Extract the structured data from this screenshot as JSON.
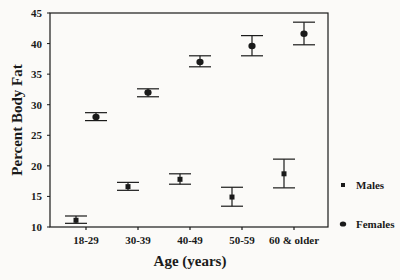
{
  "chart_data": {
    "type": "scatter",
    "subtype": "error-bar",
    "title": "",
    "xlabel": "Age (years)",
    "ylabel": "Percent Body Fat",
    "categories": [
      "18-29",
      "30-39",
      "40-49",
      "50-59",
      "60 & older"
    ],
    "ylim": [
      10,
      45
    ],
    "yticks": [
      10,
      15,
      20,
      25,
      30,
      35,
      40,
      45
    ],
    "grid": false,
    "legend_position": "right",
    "series": [
      {
        "name": "Males",
        "marker": "square",
        "values": [
          11.1,
          16.6,
          17.8,
          14.9,
          18.7
        ],
        "upper": [
          11.8,
          17.3,
          18.7,
          16.5,
          21.1
        ],
        "lower": [
          10.6,
          16.0,
          17.0,
          13.4,
          16.4
        ]
      },
      {
        "name": "Females",
        "marker": "circle",
        "values": [
          28.0,
          32.0,
          37.0,
          39.6,
          41.6
        ],
        "upper": [
          28.7,
          32.6,
          38.0,
          41.3,
          43.5
        ],
        "lower": [
          27.4,
          31.3,
          36.2,
          38.0,
          39.8
        ]
      }
    ]
  },
  "colors": {
    "ink": "#1a1a1a",
    "background": "#fbfaf8"
  }
}
